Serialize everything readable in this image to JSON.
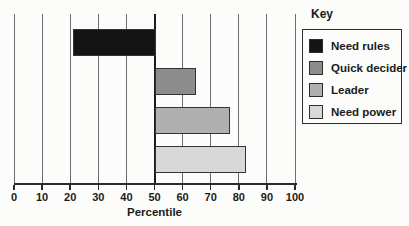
{
  "chart_data": {
    "type": "bar",
    "orientation": "horizontal",
    "title": "",
    "xlabel": "Percentile",
    "xlim": [
      0,
      100
    ],
    "xticks": [
      0,
      10,
      20,
      30,
      40,
      50,
      60,
      70,
      80,
      90,
      100
    ],
    "baseline": 50,
    "grid": "vertical",
    "categories": [
      "Need rules",
      "Quick decider",
      "Leader",
      "Need power"
    ],
    "values": [
      21,
      64,
      76,
      82
    ],
    "bar_notes": "Bars extend from the 50th-percentile baseline; 'Need rules' extends left (below median), others extend right",
    "colors": [
      "#141414",
      "#8c8c8c",
      "#b0b0b0",
      "#d8d8d8"
    ],
    "legend": {
      "title": "Key",
      "position": "right",
      "entries": [
        {
          "label": "Need rules",
          "color": "#141414"
        },
        {
          "label": "Quick decider",
          "color": "#8c8c8c"
        },
        {
          "label": "Leader",
          "color": "#b0b0b0"
        },
        {
          "label": "Need power",
          "color": "#d8d8d8"
        }
      ]
    }
  },
  "styles": {
    "background": "#fcfcfa",
    "gridline_color": "#6e6e6e",
    "baseline_color": "#1b1b1b",
    "axis_color": "#2b2b2b",
    "bar_border_color": "#333333",
    "text_color": "#1b1b1b",
    "legend_border_color": "#2e2e2e"
  }
}
